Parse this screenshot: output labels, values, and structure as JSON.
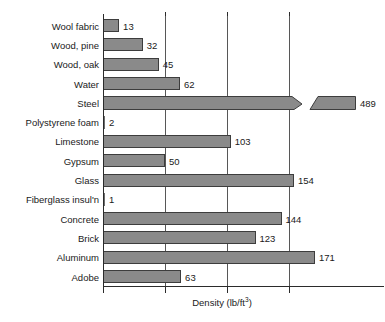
{
  "chart_data": {
    "type": "bar",
    "orientation": "horizontal",
    "title": "",
    "subtitle": "",
    "xlabel": "Density (lb/ft3)",
    "xlabel_display": "Density (lb/ft",
    "xlabel_exponent": "3",
    "xlabel_suffix": ")",
    "ylabel": "",
    "categories": [
      "Wool fabric",
      "Wood, pine",
      "Wood, oak",
      "Water",
      "Steel",
      "Polystyrene foam",
      "Limestone",
      "Gypsum",
      "Glass",
      "Fiberglass insul'n",
      "Concrete",
      "Brick",
      "Aluminum",
      "Adobe"
    ],
    "values": [
      13,
      32,
      45,
      62,
      489,
      2,
      103,
      50,
      154,
      1,
      144,
      123,
      171,
      63
    ],
    "value_labels": [
      "13",
      "32",
      "45",
      "62",
      "489",
      "2",
      "103",
      "50",
      "154",
      "1",
      "144",
      "123",
      "171",
      "63"
    ],
    "units": "lb/ft3",
    "xlim": [
      0,
      180
    ],
    "xticks": [
      0,
      50,
      100,
      150
    ],
    "xtick_labels": [
      "",
      "",
      "",
      ""
    ],
    "grid": true,
    "grid_axis": "x",
    "legend": false,
    "legend_position": "none",
    "broken_axis": true,
    "broken_series_index": 4,
    "broken_series_name": "Steel",
    "broken_series_value": 489,
    "annotations": [
      "Steel bar is drawn with an axis break; its true value 489 exceeds the plotted axis range."
    ],
    "colors": {
      "bar_fill": "#8a8a8a",
      "bar_border": "#3d3d3d",
      "gridline": "#575757",
      "axis": "#2b2b2b",
      "text": "#1a1a1a",
      "background": "#ffffff"
    }
  }
}
